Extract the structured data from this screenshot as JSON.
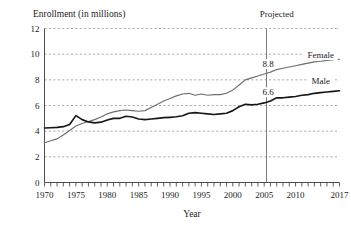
{
  "chart_data": {
    "type": "line",
    "title": "",
    "ylabel": "Enrollment (in millions)",
    "xlabel": "Year",
    "ylim": [
      0,
      12
    ],
    "xlim": [
      1970,
      2017
    ],
    "yticks": [
      0,
      2,
      4,
      6,
      8,
      10,
      12
    ],
    "ytick_labels": [
      "0",
      "2",
      "4",
      "6",
      "8",
      "10",
      "12"
    ],
    "xticks": [
      1970,
      1975,
      1980,
      1985,
      1990,
      1995,
      2000,
      2005,
      2010,
      2017
    ],
    "xtick_labels": [
      "1970",
      "1975",
      "1980",
      "1985",
      "1990",
      "1995",
      "2000",
      "2005",
      "2010",
      "2017"
    ],
    "grid": true,
    "grid_axis": "y",
    "legend_position": "inline-right",
    "minor_xticks_every": 1,
    "annotations": [
      {
        "name": "projected-label",
        "text": "Projected",
        "x": 2007,
        "y": 12.4
      },
      {
        "name": "female-value-label",
        "text": "8.8",
        "x": 2007,
        "y": 8.8
      },
      {
        "name": "male-value-label",
        "text": "6.6",
        "x": 2007,
        "y": 6.6
      },
      {
        "name": "female-series-label",
        "text": "Female",
        "x": 2014,
        "y": 9.95
      },
      {
        "name": "male-series-label",
        "text": "Male",
        "x": 2014,
        "y": 7.95
      }
    ],
    "projection_divider": {
      "x": 2007,
      "label": "Projected"
    },
    "x": [
      1970,
      1971,
      1972,
      1973,
      1974,
      1975,
      1976,
      1977,
      1978,
      1979,
      1980,
      1981,
      1982,
      1983,
      1984,
      1985,
      1986,
      1987,
      1988,
      1989,
      1990,
      1991,
      1992,
      1993,
      1994,
      1995,
      1996,
      1997,
      1998,
      1999,
      2000,
      2001,
      2002,
      2003,
      2004,
      2005,
      2006,
      2007,
      2008,
      2009,
      2010,
      2011,
      2012,
      2013,
      2014,
      2015,
      2016,
      2017
    ],
    "series": [
      {
        "name": "Male",
        "color": "#171717",
        "values": [
          4.25,
          4.27,
          4.29,
          4.35,
          4.52,
          5.21,
          4.9,
          4.72,
          4.65,
          4.7,
          4.87,
          5.0,
          5.0,
          5.16,
          5.1,
          4.95,
          4.9,
          4.95,
          5.0,
          5.05,
          5.08,
          5.12,
          5.2,
          5.4,
          5.45,
          5.4,
          5.35,
          5.3,
          5.35,
          5.4,
          5.6,
          5.9,
          6.1,
          6.05,
          6.1,
          6.2,
          6.35,
          6.6,
          6.6,
          6.65,
          6.7,
          6.8,
          6.85,
          6.95,
          7.0,
          7.05,
          7.1,
          7.15
        ]
      },
      {
        "name": "Female",
        "color": "#6d6d6d",
        "values": [
          3.1,
          3.25,
          3.4,
          3.7,
          4.05,
          4.4,
          4.6,
          4.75,
          4.9,
          5.1,
          5.35,
          5.5,
          5.6,
          5.65,
          5.6,
          5.55,
          5.6,
          5.85,
          6.1,
          6.35,
          6.55,
          6.75,
          6.9,
          6.95,
          6.8,
          6.9,
          6.8,
          6.85,
          6.85,
          6.95,
          7.2,
          7.6,
          8.0,
          8.15,
          8.3,
          8.45,
          8.6,
          8.8,
          8.9,
          9.0,
          9.1,
          9.2,
          9.3,
          9.4,
          9.45,
          9.52,
          9.57,
          9.6
        ]
      }
    ]
  }
}
